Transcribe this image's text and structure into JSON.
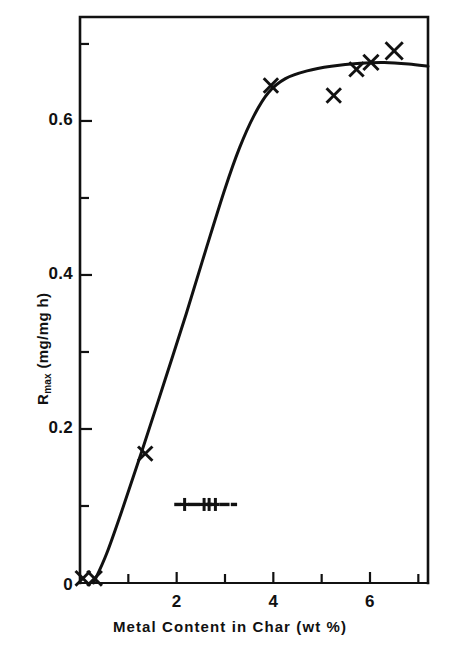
{
  "chart_data": {
    "type": "scatter",
    "title": "",
    "subtitle": "",
    "xlabel": "Metal Content in Char (wt %)",
    "ylabel": "R_max (mg/mg h)",
    "ylabel_base": "R",
    "ylabel_sub": "max",
    "ylabel_unit": "(mg/mg h)",
    "xlim": [
      0,
      7.2
    ],
    "ylim": [
      0,
      0.735
    ],
    "grid": false,
    "legend": "none",
    "x_major_ticks": [
      2,
      4,
      6
    ],
    "x_major_tick_labels": [
      "2",
      "4",
      "6"
    ],
    "x_minor_ticks": [
      1,
      3,
      5,
      7
    ],
    "y_major_ticks": [
      0,
      0.2,
      0.4,
      0.6
    ],
    "y_major_tick_labels": [
      "0",
      "0.2",
      "0.4",
      "0.6"
    ],
    "y_minor_ticks": [
      0.1,
      0.3,
      0.5,
      0.7
    ],
    "marker": "x",
    "marker_color": "#111111",
    "series": [
      {
        "name": "Rmax data",
        "marker": "x",
        "points": [
          {
            "x": 0.06,
            "y": 0.006
          },
          {
            "x": 0.3,
            "y": 0.006
          },
          {
            "x": 1.35,
            "y": 0.168
          },
          {
            "x": 3.95,
            "y": 0.646
          },
          {
            "x": 5.25,
            "y": 0.633
          },
          {
            "x": 5.72,
            "y": 0.667
          },
          {
            "x": 6.02,
            "y": 0.676
          },
          {
            "x": 6.5,
            "y": 0.691
          }
        ]
      },
      {
        "name": "fitted curve",
        "marker": "none",
        "style": "solid",
        "points": [
          {
            "x": 0.28,
            "y": 0.0
          },
          {
            "x": 0.55,
            "y": 0.038
          },
          {
            "x": 0.9,
            "y": 0.1
          },
          {
            "x": 1.3,
            "y": 0.175
          },
          {
            "x": 1.75,
            "y": 0.262
          },
          {
            "x": 2.2,
            "y": 0.35
          },
          {
            "x": 2.6,
            "y": 0.432
          },
          {
            "x": 3.0,
            "y": 0.512
          },
          {
            "x": 3.3,
            "y": 0.565
          },
          {
            "x": 3.6,
            "y": 0.607
          },
          {
            "x": 3.9,
            "y": 0.637
          },
          {
            "x": 4.25,
            "y": 0.655
          },
          {
            "x": 4.7,
            "y": 0.665
          },
          {
            "x": 5.2,
            "y": 0.671
          },
          {
            "x": 5.8,
            "y": 0.675
          },
          {
            "x": 6.3,
            "y": 0.676
          },
          {
            "x": 6.8,
            "y": 0.674
          },
          {
            "x": 7.2,
            "y": 0.671
          }
        ]
      }
    ],
    "annotations": [
      {
        "name": "legend-sample-line",
        "type": "dash-plus-line",
        "x_start": 1.95,
        "x_end": 3.25,
        "y": 0.102,
        "description": "dash plus dash plus plus dash sample line"
      }
    ]
  },
  "axes": {
    "frame": {
      "left": 80,
      "right": 428,
      "top": 17,
      "bottom": 583
    },
    "frame_color": "#111111"
  }
}
